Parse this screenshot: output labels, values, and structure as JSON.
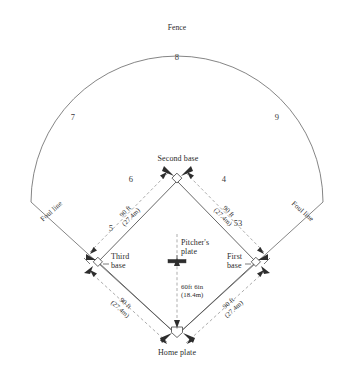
{
  "diagram": {
    "fence_label": "Fence",
    "foul_line_left": "Foul line",
    "foul_line_right": "Foul line",
    "bases": {
      "second": "Second base",
      "third_line1": "Third",
      "third_line2": "base",
      "first_line1": "First",
      "first_line2": "base",
      "home": "Home plate",
      "pitcher_line1": "Pitcher's",
      "pitcher_line2": "plate"
    },
    "dimensions": {
      "baseline_feet": "90 ft",
      "baseline_metric": "(27.4m)",
      "mound_feet": "60ft 6in",
      "mound_metric": "(18.4m)"
    },
    "positions": {
      "left_field": "7",
      "center_field": "8",
      "right_field": "9",
      "shortstop": "6",
      "second_baseman": "4",
      "third_baseman": "5",
      "first_baseman": "53"
    },
    "colors": {
      "line": "#555555",
      "dimension_line": "#7a7a7a",
      "text": "#2b2b2b",
      "background": "#ffffff"
    }
  }
}
